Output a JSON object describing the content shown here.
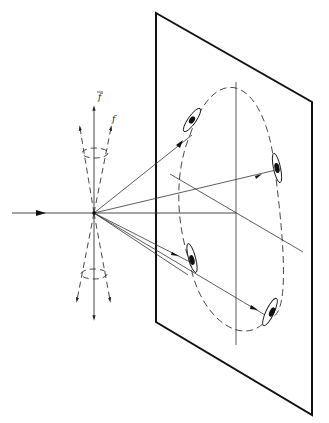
{
  "diagram": {
    "type": "optical-projection-schematic",
    "labels": {
      "upper_label": "f",
      "side_label": "f"
    },
    "colors": {
      "line": "#222222",
      "background": "#ffffff"
    },
    "elements": {
      "screen_plane": "rectangular screen in perspective",
      "incident_beam": "horizontal arrow entering from the left",
      "focus_point": "origin point where rays diverge",
      "cones": "upper and lower dashed cones with vertical axis arrows",
      "projected_ellipse": "dashed ellipse on the screen",
      "spots": 4
    }
  }
}
